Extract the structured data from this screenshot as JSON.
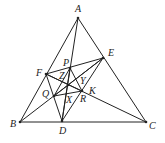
{
  "diagram": {
    "type": "geometry",
    "points": {
      "A": [
        78,
        18
      ],
      "B": [
        20,
        122
      ],
      "C": [
        146,
        122
      ],
      "D": [
        62,
        121
      ],
      "E": [
        103,
        58
      ],
      "F": [
        46,
        74
      ],
      "P": [
        70,
        68
      ],
      "Q": [
        54,
        96
      ],
      "R": [
        82,
        91
      ],
      "O": [
        68,
        85
      ]
    },
    "labels": [
      {
        "name": "A",
        "x": 75,
        "y": 12
      },
      {
        "name": "B",
        "x": 10,
        "y": 127
      },
      {
        "name": "C",
        "x": 149,
        "y": 129
      },
      {
        "name": "D",
        "x": 59,
        "y": 134
      },
      {
        "name": "E",
        "x": 108,
        "y": 56
      },
      {
        "name": "F",
        "x": 36,
        "y": 76
      },
      {
        "name": "P",
        "x": 63,
        "y": 66
      },
      {
        "name": "Q",
        "x": 42,
        "y": 97
      },
      {
        "name": "R",
        "x": 80,
        "y": 102
      },
      {
        "name": "K",
        "x": 89,
        "y": 94
      },
      {
        "name": "X",
        "x": 66,
        "y": 103
      },
      {
        "name": "Y",
        "x": 80,
        "y": 84
      },
      {
        "name": "Z",
        "x": 59,
        "y": 79
      }
    ],
    "segments": [
      [
        "A",
        "B"
      ],
      [
        "B",
        "C"
      ],
      [
        "C",
        "A"
      ],
      [
        "A",
        "D"
      ],
      [
        "B",
        "E"
      ],
      [
        "C",
        "F"
      ],
      [
        "D",
        "E"
      ],
      [
        "E",
        "F"
      ],
      [
        "F",
        "D"
      ],
      [
        "P",
        "Q"
      ],
      [
        "Q",
        "R"
      ],
      [
        "R",
        "P"
      ],
      [
        "P",
        "D"
      ],
      [
        "Q",
        "E"
      ],
      [
        "R",
        "F"
      ]
    ]
  }
}
